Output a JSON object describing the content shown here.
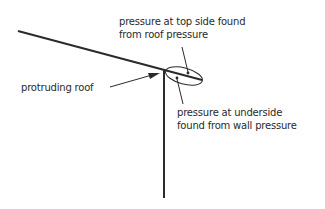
{
  "diagram": {
    "labels": {
      "top_line1": "pressure at top side found",
      "top_line2": "from roof pressure",
      "under_line1": "pressure at underside",
      "under_line2": "found from wall pressure",
      "roof": "protruding roof"
    },
    "colors": {
      "line": "#2a2a2a",
      "background": "#ffffff"
    }
  }
}
